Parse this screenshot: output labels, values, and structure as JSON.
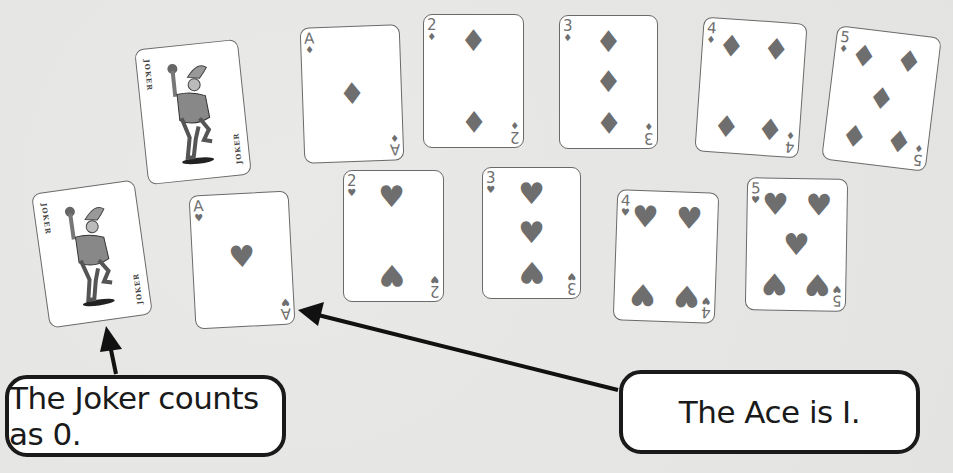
{
  "colors": {
    "background": "#e6e6e4",
    "card_face": "#ffffff",
    "card_border": "#6a6a6a",
    "pip": "#6e6e6e",
    "callout_border": "#1a1a1a",
    "text": "#1a1a1a"
  },
  "jokers": [
    {
      "label": "JOKER",
      "value_note": "counts as 0"
    },
    {
      "label": "JOKER",
      "value_note": "counts as 0"
    }
  ],
  "diamonds": {
    "suit": "diamonds",
    "suit_symbol": "♦",
    "cards": [
      {
        "rank": "A",
        "value": 1
      },
      {
        "rank": "2",
        "value": 2
      },
      {
        "rank": "3",
        "value": 3
      },
      {
        "rank": "4",
        "value": 4
      },
      {
        "rank": "5",
        "value": 5
      }
    ]
  },
  "hearts": {
    "suit": "hearts",
    "suit_symbol": "♥",
    "cards": [
      {
        "rank": "A",
        "value": 1
      },
      {
        "rank": "2",
        "value": 2
      },
      {
        "rank": "3",
        "value": 3
      },
      {
        "rank": "4",
        "value": 4
      },
      {
        "rank": "5",
        "value": 5
      }
    ]
  },
  "callouts": {
    "joker": "The Joker counts as 0.",
    "ace": "The Ace is I."
  }
}
